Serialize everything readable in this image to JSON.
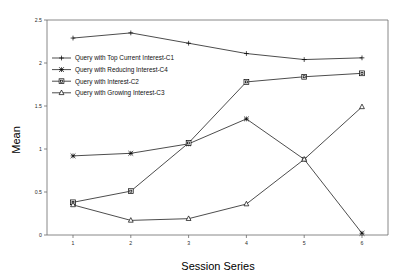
{
  "chart_data": {
    "type": "line",
    "title": "",
    "xlabel": "Session Series",
    "ylabel": "Mean",
    "categories": [
      "1",
      "2",
      "3",
      "4",
      "5",
      "6"
    ],
    "x": [
      1,
      2,
      3,
      4,
      5,
      6
    ],
    "xlim": [
      0.55,
      6.45
    ],
    "ylim": [
      0,
      2.5
    ],
    "yticks": [
      "0",
      "0.5",
      "1",
      "1.5",
      "2",
      "2.5"
    ],
    "ytick_values": [
      0,
      0.5,
      1,
      1.5,
      2,
      2.5
    ],
    "grid": false,
    "legend_position": "upper-left-inside",
    "series": [
      {
        "name": "Query with Top Current Interest-C1",
        "marker": "plus",
        "values": [
          2.29,
          2.35,
          2.23,
          2.11,
          2.04,
          2.06
        ]
      },
      {
        "name": "Query with Reducing Interest-C4",
        "marker": "x",
        "values": [
          0.92,
          0.95,
          1.06,
          1.35,
          0.88,
          0.02
        ]
      },
      {
        "name": "Query with Interest-C2",
        "marker": "square",
        "values": [
          0.38,
          0.51,
          1.07,
          1.78,
          1.84,
          1.88
        ]
      },
      {
        "name": "Query with Growing Interest-C3",
        "marker": "triangle",
        "values": [
          0.35,
          0.17,
          0.19,
          0.36,
          0.88,
          1.49
        ]
      }
    ]
  },
  "legend": {
    "items": [
      {
        "label": "Query with Top Current Interest-C1",
        "marker": "plus-marker"
      },
      {
        "label": "Query with Reducing Interest-C4",
        "marker": "x-marker"
      },
      {
        "label": "Query with Interest-C2",
        "marker": "square-marker"
      },
      {
        "label": "Query with Growing Interest-C3",
        "marker": "triangle-marker"
      }
    ]
  }
}
